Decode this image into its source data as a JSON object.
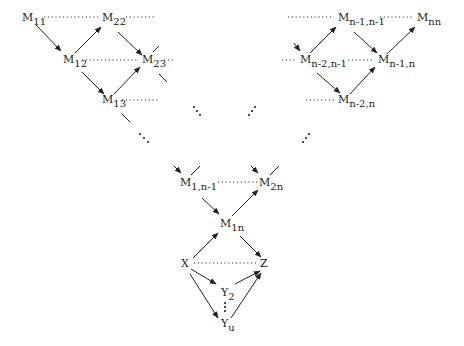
{
  "diagram": {
    "type": "lattice-dag",
    "nodes": [
      {
        "id": "M11",
        "base": "M",
        "sub": "11",
        "x": 24,
        "y": 21
      },
      {
        "id": "M22",
        "base": "M",
        "sub": "22",
        "x": 103,
        "y": 21
      },
      {
        "id": "M12",
        "base": "M",
        "sub": "12",
        "x": 64,
        "y": 62
      },
      {
        "id": "M23",
        "base": "M",
        "sub": "23",
        "x": 143,
        "y": 62
      },
      {
        "id": "M13",
        "base": "M",
        "sub": "13",
        "x": 103,
        "y": 102
      },
      {
        "id": "Mn-1n-1",
        "base": "M",
        "sub": "n-1,n-1",
        "x": 339,
        "y": 21
      },
      {
        "id": "Mnn",
        "base": "M",
        "sub": "nn",
        "x": 418,
        "y": 21
      },
      {
        "id": "Mn-2n-1",
        "base": "M",
        "sub": "n-2,n-1",
        "x": 300,
        "y": 62
      },
      {
        "id": "Mn-1n",
        "base": "M",
        "sub": "n-1,n",
        "x": 378,
        "y": 62
      },
      {
        "id": "Mn-2n",
        "base": "M",
        "sub": "n-2,n",
        "x": 339,
        "y": 102
      },
      {
        "id": "M1n-1",
        "base": "M",
        "sub": "1,n-1",
        "x": 181,
        "y": 186
      },
      {
        "id": "M2n",
        "base": "M",
        "sub": "2n",
        "x": 260,
        "y": 186
      },
      {
        "id": "M1n",
        "base": "M",
        "sub": "1n",
        "x": 220,
        "y": 226
      },
      {
        "id": "X",
        "base": "X",
        "sub": "",
        "x": 183,
        "y": 267
      },
      {
        "id": "Z",
        "base": "Z",
        "sub": "",
        "x": 262,
        "y": 267
      },
      {
        "id": "Y2",
        "base": "Y",
        "sub": "2",
        "x": 222,
        "y": 296
      },
      {
        "id": "Yu",
        "base": "Y",
        "sub": "u",
        "x": 222,
        "y": 328
      }
    ],
    "edges": [
      {
        "from": "M11",
        "to": "M12",
        "style": "arrow"
      },
      {
        "from": "M12",
        "to": "M22",
        "style": "arrow"
      },
      {
        "from": "M22",
        "to": "M23",
        "style": "arrow"
      },
      {
        "from": "M12",
        "to": "M13",
        "style": "arrow"
      },
      {
        "from": "M13",
        "to": "M23",
        "style": "arrow"
      },
      {
        "from": "Mn-2n-1",
        "to": "Mn-1n-1",
        "style": "arrow"
      },
      {
        "from": "Mn-1n-1",
        "to": "Mn-1n",
        "style": "arrow"
      },
      {
        "from": "Mn-1n",
        "to": "Mnn",
        "style": "arrow"
      },
      {
        "from": "Mn-2n-1",
        "to": "Mn-2n",
        "style": "arrow"
      },
      {
        "from": "Mn-2n",
        "to": "Mn-1n",
        "style": "arrow"
      },
      {
        "from": "M1n-1",
        "to": "M1n",
        "style": "arrow"
      },
      {
        "from": "M1n",
        "to": "M2n",
        "style": "arrow"
      },
      {
        "from": "X",
        "to": "M1n",
        "style": "arrow"
      },
      {
        "from": "M1n",
        "to": "Z",
        "style": "arrow"
      },
      {
        "from": "X",
        "to": "Y2",
        "style": "arrow"
      },
      {
        "from": "X",
        "to": "Yu",
        "style": "arrow"
      },
      {
        "from": "Y2",
        "to": "Z",
        "style": "arrow"
      },
      {
        "from": "Yu",
        "to": "Z",
        "style": "arrow"
      },
      {
        "from": "M11",
        "to": "M22",
        "style": "dotted"
      },
      {
        "from": "M12",
        "to": "M23",
        "style": "dotted"
      },
      {
        "from": "Mn-1n-1",
        "to": "Mnn",
        "style": "dotted"
      },
      {
        "from": "Mn-2n-1",
        "to": "Mn-1n",
        "style": "dotted"
      },
      {
        "from": "M1n-1",
        "to": "M2n",
        "style": "dotted"
      },
      {
        "from": "X",
        "to": "Z",
        "style": "dotted"
      }
    ],
    "ellipses": [
      {
        "symbol": "diag-down",
        "x": 142,
        "y": 130
      },
      {
        "symbol": "diag-down",
        "x": 246,
        "y": 147
      },
      {
        "symbol": "diag-up",
        "x": 306,
        "y": 137
      },
      {
        "symbol": "diag-up",
        "x": 405,
        "y": 147
      },
      {
        "symbol": "vertical",
        "x": 226,
        "y": 308
      }
    ]
  }
}
